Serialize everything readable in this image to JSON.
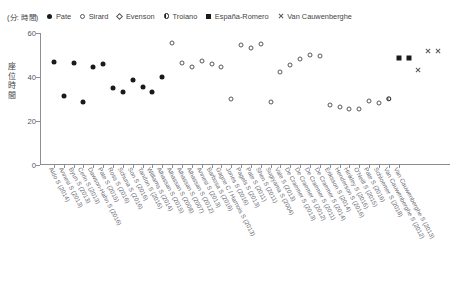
{
  "units_label": "(分: 時間)",
  "y_axis_title": "座位時間",
  "legend": [
    {
      "label": "Pate",
      "marker": "filled-circle"
    },
    {
      "label": "Sirard",
      "marker": "open-circle"
    },
    {
      "label": "Evenson",
      "marker": "open-diamond"
    },
    {
      "label": "Troiano",
      "marker": "half-circle"
    },
    {
      "label": "España-Romero",
      "marker": "filled-square"
    },
    {
      "label": "Van Cauwenberghe",
      "marker": "cross"
    }
  ],
  "chart_data": {
    "type": "scatter",
    "title": "",
    "subtitle": "",
    "xlabel": "",
    "ylabel": "座位時間",
    "units": "(分: 時間)",
    "ylim": [
      0,
      60
    ],
    "yticks": [
      0,
      20,
      40,
      60
    ],
    "grid": false,
    "legend_position": "top",
    "categories": [
      "Aldo S (2014)",
      "Annesi S (2013)",
      "Byun S (2013)",
      "Cerin S (2013)",
      "Dawson-Hahn S (2016)",
      "Pate S (2015)",
      "Ross S (2016)",
      "Schuna S (2016)",
      "Son S (2016)",
      "Tandon S (2016)",
      "Williams S (2014)",
      "Alhassan S (2015)",
      "Alhassan S (2008)",
      "Alhassan S (2007)",
      "Alhassan S (2012)",
      "Annesi S (2013)",
      "Barbosa S (2016)",
      "Gagne C / Harnois S (2013)",
      "Jones S (2016)",
      "Pagels S (2013)",
      "Pate S (2011)",
      "Shen S (2011)",
      "Sugiyama S (2004)",
      "Vale S (2013)",
      "De Craemer S (2013)",
      "De Craemer S (2012)",
      "De Craemer S (2011)",
      "De Craemer S (2014)",
      "Eriksson S (2014)",
      "Henderson S (2016)",
      "Hinkley S (2016)",
      "O'Neill S (2015)",
      "Pate S (2016)",
      "Schloemer S (2018)",
      "Van Cauwenberghe S (2012)",
      "Van Cauwenberghe S (2013)"
    ],
    "series": [
      {
        "name": "Pate",
        "marker": "filled-circle",
        "points": [
          {
            "category": "Aldo S (2014)",
            "x": 0,
            "y": 47.0
          },
          {
            "category": "Annesi S (2013)",
            "x": 1,
            "y": 31.5
          },
          {
            "category": "Byun S (2013)",
            "x": 2,
            "y": 46.5
          },
          {
            "category": "Cerin S (2013)",
            "x": 3,
            "y": 28.5
          },
          {
            "category": "Dawson-Hahn S (2016)",
            "x": 4,
            "y": 44.5
          },
          {
            "category": "Pate S (2015)",
            "x": 5,
            "y": 46.0
          },
          {
            "category": "Ross S (2016)",
            "x": 6,
            "y": 35.0
          },
          {
            "category": "Schuna S (2016)",
            "x": 7,
            "y": 33.0
          },
          {
            "category": "Son S (2016)",
            "x": 8,
            "y": 38.5
          },
          {
            "category": "Tandon S (2016)",
            "x": 9,
            "y": 35.5
          },
          {
            "category": "Williams S (2014)",
            "x": 10,
            "y": 33.0
          },
          {
            "category": "Alhassan S (2015)",
            "x": 11,
            "y": 40.0
          }
        ]
      },
      {
        "name": "Sirard",
        "marker": "open-circle",
        "points": [
          {
            "category": "Alhassan S (2008)",
            "x": 12,
            "y": 55.5
          },
          {
            "category": "Alhassan S (2007)",
            "x": 13,
            "y": 46.5
          },
          {
            "category": "Alhassan S (2012)",
            "x": 14,
            "y": 44.5
          },
          {
            "category": "Annesi S (2013)",
            "x": 15,
            "y": 47.5
          },
          {
            "category": "Barbosa S (2016)",
            "x": 16,
            "y": 46.0
          },
          {
            "category": "Gagne C / Harnois S (2013)",
            "x": 17,
            "y": 44.5
          },
          {
            "category": "Jones S (2016)",
            "x": 18,
            "y": 30.0
          },
          {
            "category": "Pagels S (2013)",
            "x": 19,
            "y": 54.5
          },
          {
            "category": "Pate S (2011)",
            "x": 20,
            "y": 53.0
          },
          {
            "category": "Shen S (2011)",
            "x": 21,
            "y": 55.0
          },
          {
            "category": "Sugiyama S (2004)",
            "x": 22,
            "y": 28.5
          },
          {
            "category": "Vale S (2013)",
            "x": 23,
            "y": 42.5
          },
          {
            "category": "De Craemer S (2013)",
            "x": 24,
            "y": 45.5
          },
          {
            "category": "De Craemer S (2012)",
            "x": 25,
            "y": 48.0
          },
          {
            "category": "De Craemer S (2011)",
            "x": 26,
            "y": 50.0
          },
          {
            "category": "De Craemer S (2014)",
            "x": 27,
            "y": 49.5
          },
          {
            "category": "Eriksson S (2014)",
            "x": 28,
            "y": 27.5
          },
          {
            "category": "Henderson S (2016)",
            "x": 29,
            "y": 26.5
          },
          {
            "category": "Hinkley S (2016)",
            "x": 30,
            "y": 25.5
          },
          {
            "category": "O'Neill S (2015)",
            "x": 31,
            "y": 25.5
          },
          {
            "category": "Pate S (2016)",
            "x": 32,
            "y": 29.0
          },
          {
            "category": "Schloemer S (2018)",
            "x": 33,
            "y": 28.0
          }
        ]
      },
      {
        "name": "Evenson",
        "marker": "open-diamond",
        "points": []
      },
      {
        "name": "Troiano",
        "marker": "half-circle",
        "points": [
          {
            "category": "Van Cauwenberghe S (2012)",
            "x": 34,
            "y": 30.0
          }
        ]
      },
      {
        "name": "España-Romero",
        "marker": "filled-square",
        "points": [
          {
            "category": "Van Cauwenberghe S (2012)",
            "x": 35,
            "y": 48.5
          },
          {
            "category": "Van Cauwenberghe S (2013)",
            "x": 36,
            "y": 48.5
          }
        ]
      },
      {
        "name": "Van Cauwenberghe",
        "marker": "cross",
        "points": [
          {
            "category": "Van Cauwenberghe S (2012)",
            "x": 37,
            "y": 43.0
          },
          {
            "category": "Van Cauwenberghe S (2013)",
            "x": 38,
            "y": 52.0
          },
          {
            "category": "Van Cauwenberghe S (2013)",
            "x": 39,
            "y": 52.0
          }
        ]
      }
    ]
  }
}
